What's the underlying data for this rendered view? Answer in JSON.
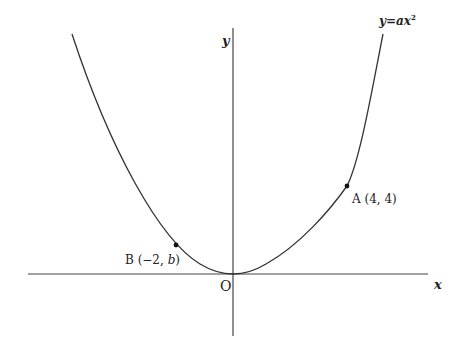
{
  "diagram": {
    "type": "parabola-graph",
    "colors": {
      "stroke": "#333333",
      "text": "#222222",
      "background": "#ffffff"
    },
    "curve_label": {
      "y": "y",
      "eq": "=",
      "a": "a",
      "x": "x",
      "exp": "2"
    },
    "axes": {
      "x_label": "x",
      "y_label": "y",
      "origin_label": "O"
    },
    "points": [
      {
        "name": "A",
        "label": "A (4, 4)",
        "x": 4,
        "y": 4
      },
      {
        "name": "B",
        "label_prefix": "B (−2,",
        "label_var": "b",
        "label_suffix": ")",
        "x": -2,
        "y": "b"
      }
    ]
  }
}
